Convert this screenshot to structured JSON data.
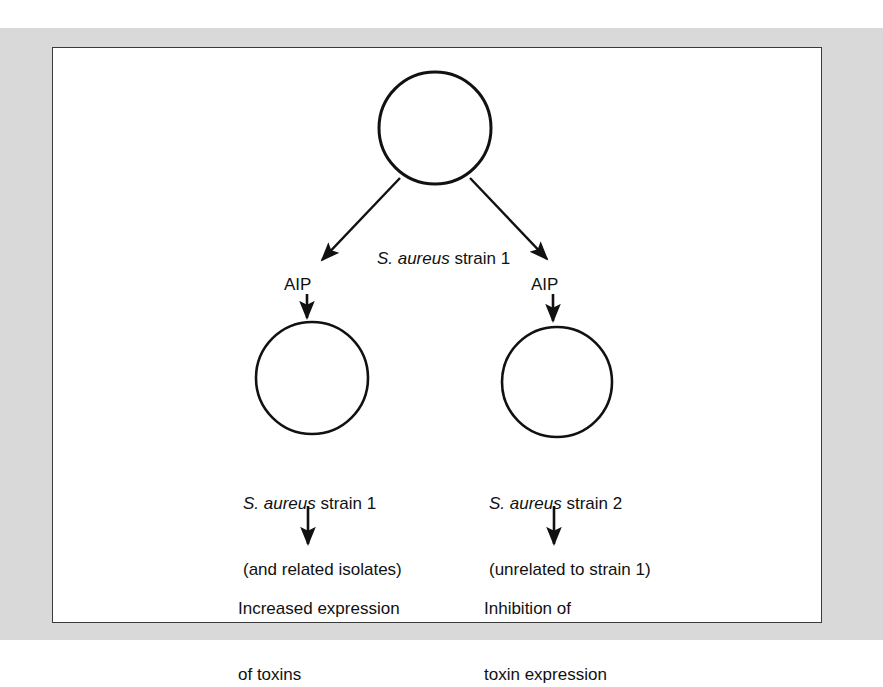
{
  "figure": {
    "type": "flow-diagram",
    "background_color": "#ffffff",
    "mat_color": "#d9d9d9",
    "panel_border_color": "#3a3a3a",
    "ink_color": "#111111",
    "nodes": {
      "source_cell": {
        "name": "top-bacterium-circle",
        "shape": "circle",
        "cx": 435,
        "cy": 128,
        "r": 56
      },
      "left_cell": {
        "name": "left-bacterium-circle",
        "shape": "circle",
        "cx": 312,
        "cy": 378,
        "r": 56
      },
      "right_cell": {
        "name": "right-bacterium-circle",
        "shape": "circle",
        "cx": 557,
        "cy": 382,
        "r": 55
      }
    },
    "labels": {
      "source_strain_genus": "S. aureus",
      "source_strain_rest": " strain 1",
      "signal_left": "AIP",
      "signal_right": "AIP",
      "left_target_genus": "S. aureus",
      "left_target_rest": " strain 1",
      "left_target_line2": "(and related isolates)",
      "right_target_genus": "S. aureus",
      "right_target_rest": " strain 2",
      "right_target_line2": "(unrelated to strain 1)",
      "left_outcome_line1": "Increased expression",
      "left_outcome_line2": "of toxins",
      "right_outcome_line1": "Inhibition of",
      "right_outcome_line2": "toxin expression"
    },
    "arrows": [
      {
        "name": "arrow-source-to-left",
        "style": "diagonal",
        "x1": 400,
        "y1": 178,
        "x2": 320,
        "y2": 262
      },
      {
        "name": "arrow-source-to-right",
        "style": "diagonal",
        "x1": 470,
        "y1": 178,
        "x2": 549,
        "y2": 261
      },
      {
        "name": "arrow-aip-left-down",
        "style": "vertical",
        "x1": 307,
        "y1": 294,
        "x2": 307,
        "y2": 320
      },
      {
        "name": "arrow-aip-right-down",
        "style": "vertical",
        "x1": 553,
        "y1": 294,
        "x2": 553,
        "y2": 323
      },
      {
        "name": "arrow-left-outcome-down",
        "style": "vertical",
        "x1": 308,
        "y1": 506,
        "x2": 308,
        "y2": 546
      },
      {
        "name": "arrow-right-outcome-down",
        "style": "vertical",
        "x1": 554,
        "y1": 506,
        "x2": 554,
        "y2": 546
      }
    ]
  }
}
